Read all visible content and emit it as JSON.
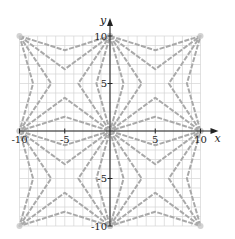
{
  "figure": {
    "axes": {
      "x_label": "x",
      "y_label": "y",
      "x_range": [
        -10,
        10
      ],
      "y_range": [
        -10,
        10
      ],
      "grid_step": 1,
      "x_tick_labels": [
        {
          "value": -10,
          "label": "-10"
        },
        {
          "value": -5,
          "label": "-5"
        },
        {
          "value": 5,
          "label": "5"
        },
        {
          "value": 10,
          "label": "10"
        }
      ],
      "y_tick_labels": [
        {
          "value": 10,
          "label": "10"
        },
        {
          "value": 5,
          "label": "5"
        },
        {
          "value": -5,
          "label": "-5"
        },
        {
          "value": -10,
          "label": "-10"
        }
      ]
    },
    "pattern": {
      "quadrant_centers": [
        [
          -5,
          5
        ],
        [
          5,
          5
        ],
        [
          -5,
          -5
        ],
        [
          5,
          -5
        ]
      ],
      "half_size": 5,
      "star_point_offsets": [
        3.5,
        1.5
      ],
      "line_color": "#a9a9a9",
      "grid_color": "#d4d4d4",
      "axis_color": "#222222"
    }
  }
}
